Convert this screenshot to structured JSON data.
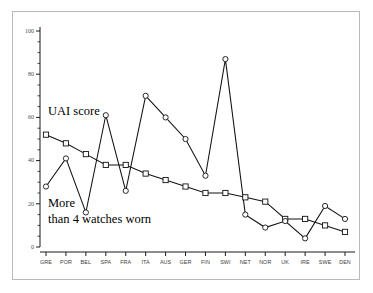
{
  "figure": {
    "background_color": "#ffffff",
    "frame_color": "#b9b9b9",
    "line_color": "#111111"
  },
  "annotations": {
    "upper": "UAI score",
    "lower_line1": "More",
    "lower_line2": "than 4 watches worn"
  },
  "axes": {
    "y_ticks": [
      "0",
      "20",
      "40",
      "60",
      "80",
      "100"
    ],
    "y_tick_values": [
      0,
      20,
      40,
      60,
      80,
      100
    ],
    "y_minor_step": 5,
    "x_labels": [
      "GRE",
      "POR",
      "BEL",
      "SPA",
      "FRA",
      "ITA",
      "AUS",
      "GER",
      "FIN",
      "SWI",
      "NET",
      "NOR",
      "UK",
      "IRE",
      "SWE",
      "DEN"
    ]
  },
  "chart_data": {
    "type": "line",
    "title": "",
    "subtitle": "",
    "xlabel": "",
    "ylabel": "",
    "ylim": [
      0,
      100
    ],
    "grid": false,
    "legend_position": "inline-annotation",
    "categories": [
      "GRE",
      "POR",
      "BEL",
      "SPA",
      "FRA",
      "ITA",
      "AUS",
      "GER",
      "FIN",
      "SWI",
      "NET",
      "NOR",
      "UK",
      "IRE",
      "SWE",
      "DEN"
    ],
    "series": [
      {
        "name": "UAI score",
        "marker": "square",
        "values": [
          52,
          48,
          43,
          38,
          38,
          34,
          31,
          28,
          25,
          25,
          23,
          21,
          13,
          13,
          10,
          7
        ]
      },
      {
        "name": "More than 4 watches worn",
        "marker": "circle",
        "values": [
          28,
          41,
          16,
          61,
          26,
          70,
          60,
          50,
          33,
          87,
          15,
          9,
          12,
          4,
          19,
          13
        ]
      }
    ]
  }
}
